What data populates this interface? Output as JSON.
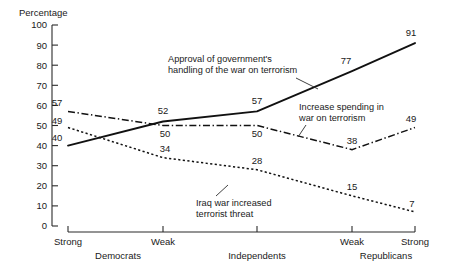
{
  "chart_data": {
    "type": "line",
    "title": "",
    "ylabel": "Percentage",
    "xlabel": "",
    "ylim": [
      0,
      100
    ],
    "ytick_labels": [
      "100",
      "90",
      "80",
      "70",
      "60",
      "50",
      "40",
      "30",
      "20",
      "10",
      "0"
    ],
    "ytick_values": [
      100,
      90,
      80,
      70,
      60,
      50,
      40,
      30,
      20,
      10,
      0
    ],
    "grid": false,
    "legend": "annotations-on-plot",
    "categories": [
      "Strong",
      "Weak",
      "Independents",
      "Weak",
      "Strong"
    ],
    "group_labels": [
      "Democrats",
      "Independents",
      "Republicans"
    ],
    "xtick_labels": [
      "Strong",
      "Weak",
      "",
      "Weak",
      "Strong"
    ],
    "series": [
      {
        "name": "Approval of government's handling of the war on terrorism",
        "style": "solid",
        "values": [
          40,
          52,
          57,
          77,
          91
        ]
      },
      {
        "name": "Increase spending in war on terrorism",
        "style": "dash-dot",
        "values": [
          57,
          50,
          50,
          38,
          49
        ]
      },
      {
        "name": "Iraq war increased terrorist threat",
        "style": "dotted",
        "values": [
          49,
          34,
          28,
          15,
          7
        ]
      }
    ],
    "annotations": [
      {
        "id": "approval",
        "line1": "Approval of government's",
        "line2": "handling of the war on terrorism"
      },
      {
        "id": "spending",
        "line1": "Increase spending in",
        "line2": "war on terrorism"
      },
      {
        "id": "iraq",
        "line1": "Iraq war increased",
        "line2": "terrorist threat"
      }
    ],
    "data_labels": {
      "solid": [
        "40",
        "52",
        "57",
        "77",
        "91"
      ],
      "dashdot": [
        "57",
        "50",
        "50",
        "38",
        "49"
      ],
      "dotted": [
        "49",
        "34",
        "28",
        "15",
        "7"
      ]
    },
    "colors": {
      "ink": "#111111",
      "axis": "#2b2b2b",
      "background": "#ffffff"
    }
  }
}
